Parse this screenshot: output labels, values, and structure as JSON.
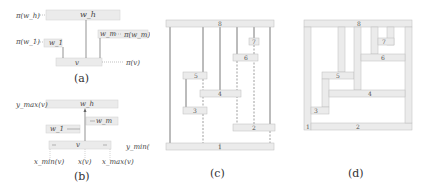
{
  "panels": {
    "a": {
      "caption": "(a)",
      "labels": {
        "pi_wh": "π(w_h)",
        "pi_w1": "π(w_1)",
        "pi_wm": "π(w_m)",
        "pi_v": "π(v)",
        "wh": "w_h",
        "w1": "w_1",
        "wm": "w_m",
        "v": "v"
      }
    },
    "b": {
      "caption": "(b)",
      "labels": {
        "ymax": "y_max(v)",
        "ymin": "y_min(v)",
        "xmin": "x_min(v)",
        "xv": "x(v)",
        "xmax": "x_max(v)",
        "wh": "w_h",
        "w1": "w_1",
        "wm": "w_m",
        "v": "v"
      }
    },
    "c": {
      "caption": "(c)",
      "boxes": [
        "1",
        "2",
        "3",
        "4",
        "5",
        "6",
        "7",
        "8"
      ]
    },
    "d": {
      "caption": "(d)",
      "boxes": [
        "1",
        "2",
        "3",
        "4",
        "5",
        "6",
        "7",
        "8"
      ]
    }
  },
  "colors": {
    "box_fill": "#ebebeb",
    "box_stroke": "#bdbdbd",
    "line": "#555555",
    "dashed": "#777777"
  }
}
